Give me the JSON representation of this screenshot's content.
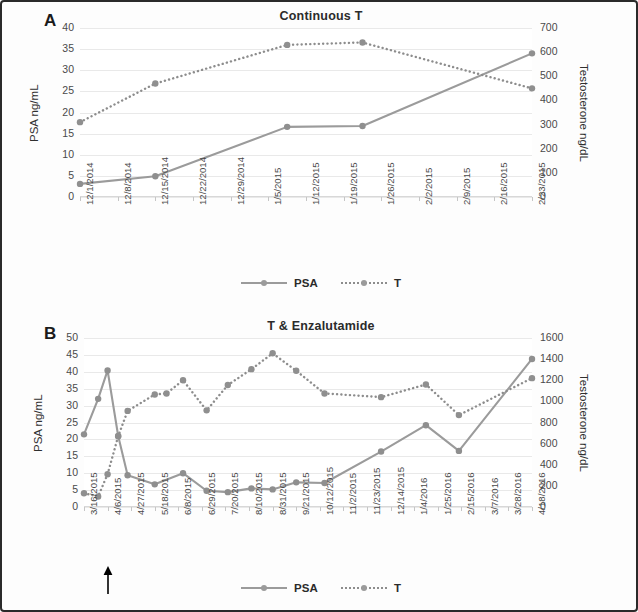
{
  "figure": {
    "panels": [
      "A",
      "B"
    ]
  },
  "panel_a": {
    "letter": "A",
    "legend": [
      {
        "name": "legend-psa",
        "label": "PSA",
        "style": "solid"
      },
      {
        "name": "legend-t",
        "label": "T",
        "style": "dotted"
      }
    ],
    "chart_data": {
      "type": "line",
      "title": "Continuous T",
      "xlabel": "",
      "ylabel": "PSA ng/mL",
      "y2label": "Testosterone ng/dL",
      "grid": true,
      "legend_position": "bottom",
      "ylim": [
        0,
        40
      ],
      "yticks": [
        0,
        5,
        10,
        15,
        20,
        25,
        30,
        35,
        40
      ],
      "y2lim": [
        0,
        700
      ],
      "y2ticks": [
        0,
        100,
        200,
        300,
        400,
        500,
        600,
        700
      ],
      "categories": [
        "12/1/2014",
        "12/8/2014",
        "12/15/2014",
        "12/22/2014",
        "12/29/2014",
        "1/5/2015",
        "1/12/2015",
        "1/19/2015",
        "1/26/2015",
        "2/2/2015",
        "2/9/2015",
        "2/16/2015",
        "2/23/2015"
      ],
      "series": [
        {
          "name": "PSA",
          "axis": "left",
          "style": "solid",
          "points": [
            {
              "x": 0.0,
              "y": 3.1
            },
            {
              "x": 2.0,
              "y": 4.9
            },
            {
              "x": 5.5,
              "y": 16.6
            },
            {
              "x": 7.5,
              "y": 16.8
            },
            {
              "x": 12.0,
              "y": 34.0
            }
          ]
        },
        {
          "name": "T",
          "axis": "right",
          "style": "dotted",
          "points": [
            {
              "x": 0.0,
              "y": 310
            },
            {
              "x": 2.0,
              "y": 470
            },
            {
              "x": 5.5,
              "y": 630
            },
            {
              "x": 7.5,
              "y": 640
            },
            {
              "x": 12.0,
              "y": 450
            }
          ]
        }
      ]
    }
  },
  "panel_b": {
    "letter": "B",
    "annotation": {
      "name": "treatment-start-arrow",
      "at_category": "4/6/2015"
    },
    "legend": [
      {
        "name": "legend-psa",
        "label": "PSA",
        "style": "solid"
      },
      {
        "name": "legend-t",
        "label": "T",
        "style": "dotted"
      }
    ],
    "chart_data": {
      "type": "line",
      "title": "T & Enzalutamide",
      "xlabel": "",
      "ylabel": "PSA ng/mL",
      "y2label": "Testosterone ng/dL",
      "grid": true,
      "legend_position": "bottom",
      "ylim": [
        0,
        50
      ],
      "yticks": [
        0,
        5,
        10,
        15,
        20,
        25,
        30,
        35,
        40,
        45,
        50
      ],
      "y2lim": [
        0,
        1600
      ],
      "y2ticks": [
        0,
        200,
        400,
        600,
        800,
        1000,
        1200,
        1400,
        1600
      ],
      "categories": [
        "3/16/2015",
        "4/6/2015",
        "4/27/2015",
        "5/18/2015",
        "6/8/2015",
        "6/29/2015",
        "7/20/2015",
        "8/10/2015",
        "8/31/2015",
        "9/21/2015",
        "10/12/2015",
        "11/2/2015",
        "11/23/2015",
        "12/14/2015",
        "1/4/2016",
        "1/25/2016",
        "2/15/2016",
        "3/7/2016",
        "3/28/2016",
        "4/18/2016"
      ],
      "series": [
        {
          "name": "PSA",
          "axis": "left",
          "style": "solid",
          "points": [
            {
              "x": 0.0,
              "y": 21.5
            },
            {
              "x": 0.6,
              "y": 32.0
            },
            {
              "x": 1.0,
              "y": 40.4
            },
            {
              "x": 1.45,
              "y": 21.0
            },
            {
              "x": 1.85,
              "y": 9.4
            },
            {
              "x": 3.0,
              "y": 6.7
            },
            {
              "x": 4.2,
              "y": 10.0
            },
            {
              "x": 5.2,
              "y": 4.8
            },
            {
              "x": 6.1,
              "y": 4.4
            },
            {
              "x": 7.1,
              "y": 5.5
            },
            {
              "x": 8.0,
              "y": 5.2
            },
            {
              "x": 9.0,
              "y": 7.3
            },
            {
              "x": 10.2,
              "y": 7.1
            },
            {
              "x": 12.6,
              "y": 16.4
            },
            {
              "x": 14.5,
              "y": 24.2
            },
            {
              "x": 15.9,
              "y": 16.6
            },
            {
              "x": 19.0,
              "y": 43.8
            }
          ]
        },
        {
          "name": "T",
          "axis": "right",
          "style": "dotted",
          "points": [
            {
              "x": 0.0,
              "y": 130
            },
            {
              "x": 0.6,
              "y": 100
            },
            {
              "x": 1.0,
              "y": 310
            },
            {
              "x": 1.45,
              "y": 670
            },
            {
              "x": 1.85,
              "y": 910
            },
            {
              "x": 3.0,
              "y": 1065
            },
            {
              "x": 3.5,
              "y": 1075
            },
            {
              "x": 4.2,
              "y": 1200
            },
            {
              "x": 5.2,
              "y": 915
            },
            {
              "x": 6.1,
              "y": 1155
            },
            {
              "x": 7.1,
              "y": 1305
            },
            {
              "x": 8.0,
              "y": 1455
            },
            {
              "x": 9.0,
              "y": 1290
            },
            {
              "x": 10.2,
              "y": 1075
            },
            {
              "x": 12.6,
              "y": 1040
            },
            {
              "x": 14.5,
              "y": 1160
            },
            {
              "x": 15.9,
              "y": 870
            },
            {
              "x": 19.0,
              "y": 1220
            }
          ]
        }
      ]
    }
  },
  "colors": {
    "psa_line": "#9b9b9b",
    "t_line": "#8d8d8d",
    "marker": "#8f8f8f",
    "grid": "#e9e9e9",
    "text": "#3a3a3a",
    "arrow": "#000000",
    "frame": "#2a2a2a"
  }
}
